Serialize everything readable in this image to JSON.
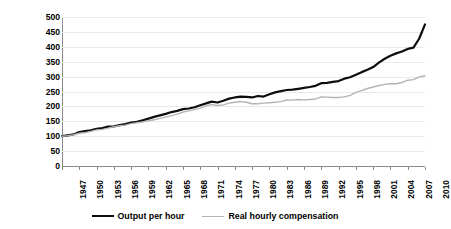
{
  "chart_data": {
    "type": "line",
    "title": "",
    "xlabel": "",
    "ylabel": "Index: 1947 level = 100",
    "ylim": [
      0,
      500
    ],
    "ytick_step": 50,
    "yticks": [
      "500",
      "450",
      "400",
      "350",
      "300",
      "250",
      "200",
      "150",
      "100",
      "50",
      "0"
    ],
    "grid": "horizontal",
    "legend_position": "bottom",
    "xlim": [
      1947,
      2010
    ],
    "tick_labels": [
      "1947",
      "1950",
      "1953",
      "1956",
      "1959",
      "1962",
      "1965",
      "1968",
      "1971",
      "1974",
      "1977",
      "1980",
      "1983",
      "1986",
      "1989",
      "1992",
      "1995",
      "1998",
      "2001",
      "2004",
      "2007",
      "2010"
    ],
    "x": [
      1947,
      1948,
      1949,
      1950,
      1951,
      1952,
      1953,
      1954,
      1955,
      1956,
      1957,
      1958,
      1959,
      1960,
      1961,
      1962,
      1963,
      1964,
      1965,
      1966,
      1967,
      1968,
      1969,
      1970,
      1971,
      1972,
      1973,
      1974,
      1975,
      1976,
      1977,
      1978,
      1979,
      1980,
      1981,
      1982,
      1983,
      1984,
      1985,
      1986,
      1987,
      1988,
      1989,
      1990,
      1991,
      1992,
      1993,
      1994,
      1995,
      1996,
      1997,
      1998,
      1999,
      2000,
      2001,
      2002,
      2003,
      2004,
      2005,
      2006,
      2007,
      2008,
      2009,
      2010
    ],
    "series": [
      {
        "name": "Output per hour",
        "color": "#0d0d0d",
        "width": 2.2,
        "values": [
          100,
          103,
          106,
          114,
          117,
          120,
          125,
          127,
          132,
          133,
          137,
          141,
          146,
          148,
          153,
          159,
          165,
          170,
          175,
          181,
          185,
          191,
          193,
          197,
          204,
          210,
          216,
          213,
          219,
          226,
          230,
          233,
          232,
          230,
          235,
          233,
          241,
          247,
          251,
          255,
          256,
          259,
          262,
          265,
          269,
          278,
          279,
          282,
          285,
          293,
          298,
          306,
          315,
          323,
          332,
          347,
          360,
          370,
          378,
          384,
          393,
          397,
          428,
          440
        ],
        "endpoint_value": 475
      },
      {
        "name": "Real hourly compensation",
        "color": "#b4b4b4",
        "width": 1.4,
        "values": [
          100,
          102,
          105,
          110,
          112,
          116,
          121,
          123,
          127,
          132,
          135,
          137,
          142,
          145,
          148,
          152,
          155,
          160,
          164,
          169,
          174,
          181,
          185,
          189,
          194,
          202,
          206,
          203,
          205,
          211,
          214,
          216,
          214,
          209,
          209,
          211,
          212,
          214,
          216,
          222,
          221,
          223,
          222,
          223,
          225,
          232,
          231,
          230,
          230,
          232,
          237,
          247,
          253,
          260,
          265,
          270,
          274,
          276,
          276,
          280,
          288,
          290,
          299,
          303
        ],
        "endpoint_value": 303
      }
    ]
  },
  "legend": {
    "items": [
      {
        "label": "Output per hour"
      },
      {
        "label": "Real hourly compensation"
      }
    ]
  },
  "colors": {
    "series1": "#0d0d0d",
    "series2": "#b4b4b4",
    "gridline": "#e9e9e9",
    "axis": "#8a8a8a",
    "background": "#ffffff"
  }
}
